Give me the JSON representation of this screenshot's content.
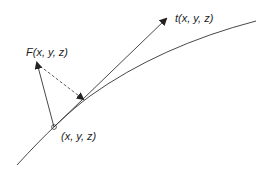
{
  "labels": {
    "force": "F(x, y, z)",
    "tangent": "t(x, y, z)",
    "point": "(x, y, z)"
  },
  "colors": {
    "stroke": "#333333",
    "background": "#ffffff"
  }
}
